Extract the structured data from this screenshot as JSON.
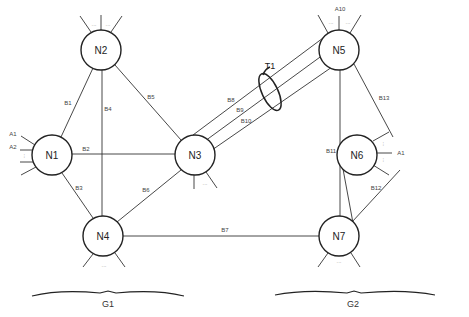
{
  "diagram": {
    "nodes": [
      {
        "id": "N1",
        "label": "N1",
        "x": 52,
        "y": 155
      },
      {
        "id": "N2",
        "label": "N2",
        "x": 101,
        "y": 50
      },
      {
        "id": "N3",
        "label": "N3",
        "x": 195,
        "y": 155
      },
      {
        "id": "N4",
        "label": "N4",
        "x": 103,
        "y": 236
      },
      {
        "id": "N5",
        "label": "N5",
        "x": 339,
        "y": 50
      },
      {
        "id": "N6",
        "label": "N6",
        "x": 357,
        "y": 155
      },
      {
        "id": "N7",
        "label": "N7",
        "x": 339,
        "y": 236
      }
    ],
    "edges": [
      {
        "id": "B1",
        "label": "B1",
        "from": "N1",
        "to": "N2"
      },
      {
        "id": "B2",
        "label": "B2",
        "from": "N1",
        "to": "N3"
      },
      {
        "id": "B3",
        "label": "B3",
        "from": "N1",
        "to": "N4"
      },
      {
        "id": "B4",
        "label": "B4",
        "from": "N2",
        "to": "N4"
      },
      {
        "id": "B5",
        "label": "B5",
        "from": "N2",
        "to": "N3"
      },
      {
        "id": "B6",
        "label": "B6",
        "from": "N3",
        "to": "N4"
      },
      {
        "id": "B7",
        "label": "B7",
        "from": "N4",
        "to": "N7"
      },
      {
        "id": "B8",
        "label": "B8",
        "from": "N3",
        "to": "N5"
      },
      {
        "id": "B9",
        "label": "B9",
        "from": "N3",
        "to": "N5"
      },
      {
        "id": "B10",
        "label": "B10",
        "from": "N3",
        "to": "N5"
      },
      {
        "id": "B11",
        "label": "B11",
        "from": "N5",
        "to": "N7"
      },
      {
        "id": "B12",
        "label": "B12",
        "from": "N6",
        "to": "N7"
      },
      {
        "id": "B13",
        "label": "B13",
        "from": "N5",
        "to": "N6"
      }
    ],
    "trunk": {
      "label": "T1",
      "bundles": [
        "B8",
        "B9",
        "B10"
      ]
    },
    "access_labels": {
      "n1_a1": "A1",
      "n1_a2": "A2",
      "n5_a10": "A10",
      "n6_a1": "A1"
    },
    "ellipsis": "...",
    "groups": [
      {
        "label": "G1",
        "nodes": [
          "N1",
          "N2",
          "N3",
          "N4"
        ]
      },
      {
        "label": "G2",
        "nodes": [
          "N5",
          "N6",
          "N7"
        ]
      }
    ]
  }
}
